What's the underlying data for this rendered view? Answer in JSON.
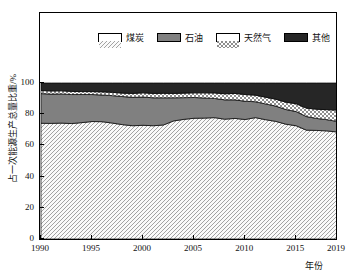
{
  "chart_data": {
    "type": "area",
    "stacked": true,
    "title": "",
    "subtitle": "",
    "xlabel": "年份",
    "ylabel": "占一次能源生产总量比重/%",
    "xlim": [
      1990,
      2019
    ],
    "ylim": [
      0,
      100
    ],
    "grid": false,
    "legend_position": "top-inside",
    "x_ticks": [
      "1990",
      "1995",
      "2000",
      "2005",
      "2010",
      "2015",
      "2019"
    ],
    "x_tick_values": [
      1990,
      1995,
      2000,
      2005,
      2010,
      2015,
      2019
    ],
    "y_ticks": [
      "0",
      "20",
      "40",
      "60",
      "80",
      "100"
    ],
    "y_tick_values": [
      0,
      20,
      40,
      60,
      80,
      100
    ],
    "x": [
      1990,
      1991,
      1992,
      1993,
      1994,
      1995,
      1996,
      1997,
      1998,
      1999,
      2000,
      2001,
      2002,
      2003,
      2004,
      2005,
      2006,
      2007,
      2008,
      2009,
      2010,
      2011,
      2012,
      2013,
      2014,
      2015,
      2016,
      2017,
      2018,
      2019
    ],
    "series": [
      {
        "name": "煤炭",
        "pattern": "diagonal-hatch",
        "color": "#f2f2f2",
        "values": [
          74.2,
          74.1,
          74.3,
          74.0,
          74.6,
          75.3,
          75.2,
          74.3,
          73.3,
          72.6,
          72.9,
          72.6,
          73.1,
          75.7,
          76.7,
          77.4,
          77.5,
          77.8,
          76.8,
          77.3,
          76.6,
          77.8,
          76.5,
          75.4,
          73.6,
          72.6,
          69.8,
          69.6,
          69.3,
          68.6
        ],
        "unit": "%"
      },
      {
        "name": "石油",
        "pattern": "solid",
        "color": "#808080",
        "values": [
          19.0,
          18.8,
          18.7,
          18.6,
          18.0,
          17.3,
          17.1,
          17.6,
          18.0,
          18.2,
          18.1,
          17.9,
          17.4,
          14.8,
          13.9,
          13.3,
          12.9,
          12.3,
          12.4,
          11.9,
          11.7,
          10.2,
          10.1,
          9.8,
          9.4,
          9.1,
          8.7,
          7.7,
          7.2,
          6.8
        ],
        "unit": "%"
      },
      {
        "name": "天然气",
        "pattern": "checker-hatch",
        "color": "#ffffff",
        "values": [
          2.0,
          2.0,
          2.0,
          2.0,
          1.9,
          1.9,
          2.0,
          2.1,
          2.2,
          2.5,
          2.7,
          2.8,
          2.9,
          2.8,
          2.9,
          3.0,
          3.3,
          3.5,
          3.9,
          4.1,
          4.3,
          4.2,
          4.3,
          4.4,
          4.7,
          5.0,
          5.4,
          5.9,
          6.4,
          7.2
        ],
        "unit": "%"
      },
      {
        "name": "其他",
        "pattern": "solid",
        "color": "#262626",
        "values": [
          4.8,
          5.1,
          5.0,
          5.4,
          5.5,
          5.5,
          5.7,
          6.0,
          6.5,
          6.7,
          6.3,
          6.7,
          6.6,
          6.7,
          6.5,
          6.3,
          6.3,
          6.4,
          6.9,
          6.7,
          7.4,
          7.8,
          9.1,
          10.4,
          12.3,
          13.3,
          16.1,
          16.8,
          17.1,
          17.4
        ],
        "unit": "%"
      }
    ]
  },
  "legend": {
    "items": [
      {
        "label": "煤炭"
      },
      {
        "label": "石油"
      },
      {
        "label": "天然气"
      },
      {
        "label": "其他"
      }
    ]
  },
  "axes": {
    "x_title": "年份",
    "y_title": "占一次能源生产总量比重/%"
  }
}
